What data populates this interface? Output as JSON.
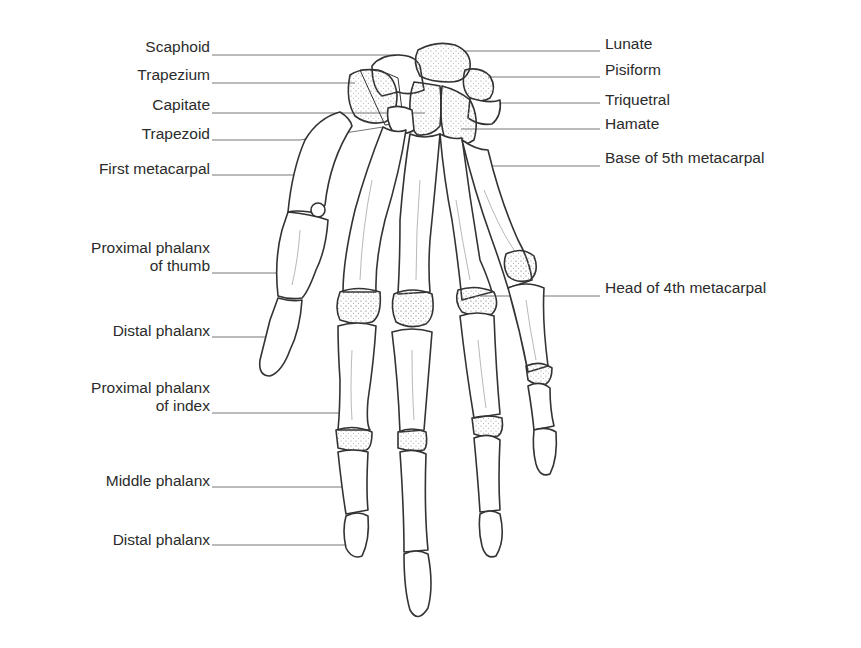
{
  "diagram": {
    "labels_left": [
      {
        "id": "scaphoid",
        "lines": [
          "Scaphoid"
        ]
      },
      {
        "id": "trapezium",
        "lines": [
          "Trapezium"
        ]
      },
      {
        "id": "capitate",
        "lines": [
          "Capitate"
        ]
      },
      {
        "id": "trapezoid",
        "lines": [
          "Trapezoid"
        ]
      },
      {
        "id": "first-metacarpal",
        "lines": [
          "First metacarpal"
        ]
      },
      {
        "id": "proximal-phalanx-thumb",
        "lines": [
          "Proximal phalanx",
          "of thumb"
        ]
      },
      {
        "id": "distal-phalanx-thumb",
        "lines": [
          "Distal phalanx"
        ]
      },
      {
        "id": "proximal-phalanx-index",
        "lines": [
          "Proximal phalanx",
          "of index"
        ]
      },
      {
        "id": "middle-phalanx",
        "lines": [
          "Middle phalanx"
        ]
      },
      {
        "id": "distal-phalanx",
        "lines": [
          "Distal phalanx"
        ]
      }
    ],
    "labels_right": [
      {
        "id": "lunate",
        "lines": [
          "Lunate"
        ]
      },
      {
        "id": "pisiform",
        "lines": [
          "Pisiform"
        ]
      },
      {
        "id": "triquetral",
        "lines": [
          "Triquetral"
        ]
      },
      {
        "id": "hamate",
        "lines": [
          "Hamate"
        ]
      },
      {
        "id": "base-5th-metacarpal",
        "lines": [
          "Base of 5th metacarpal"
        ]
      },
      {
        "id": "head-4th-metacarpal",
        "lines": [
          "Head of 4th metacarpal"
        ]
      }
    ],
    "colors": {
      "line": "#3a3a3a",
      "leader": "#555555",
      "bone_fill": "#ffffff",
      "stipple": "#8a8a8a"
    }
  }
}
